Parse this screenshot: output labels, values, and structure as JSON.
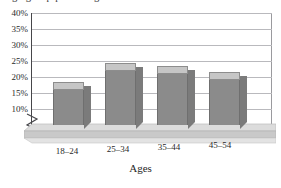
{
  "chart_data": {
    "type": "bar",
    "title": "Age group percentages",
    "title_clipped": true,
    "subtitle": "",
    "xlabel": "Ages",
    "ylabel": "",
    "categories": [
      "18–24",
      "25–34",
      "35–44",
      "45–54"
    ],
    "values": [
      16,
      22,
      21,
      19
    ],
    "value_labels": [
      "16%",
      "22%",
      "21%",
      "19%"
    ],
    "ylim": [
      10,
      40
    ],
    "ytick_values": [
      40,
      35,
      30,
      25,
      20,
      15,
      10
    ],
    "ytick_labels": [
      "40%",
      "35%",
      "30%",
      "25%",
      "20%",
      "15%",
      "10%"
    ],
    "grid": true,
    "grid_axis": "y",
    "legend": false,
    "legend_position": "none",
    "axis_break": true,
    "axis_break_note": "y-axis broken below 10%",
    "three_d": true,
    "series": [
      {
        "name": "Percent",
        "values": [
          16,
          22,
          21,
          19
        ]
      }
    ],
    "colors": {
      "bar_front": "#8b8b8b",
      "bar_top": "#c6c6c6",
      "bar_side": "#7b7b7b",
      "gridline": "#b9b9bd",
      "frame": "#46464a",
      "floor_top": "#d8d8d8",
      "floor_front": "#c0c0c0",
      "text": "#1f1f1f",
      "background": "#ffffff"
    }
  },
  "yticks": {
    "t0": "40%",
    "t1": "35%",
    "t2": "30%",
    "t3": "25%",
    "t4": "20%",
    "t5": "15%",
    "t6": "10%"
  },
  "xticks": {
    "c0": "18–24",
    "c1": "25–34",
    "c2": "35–44",
    "c3": "45–54"
  },
  "axis": {
    "x_title": "Ages"
  },
  "title": {
    "text": "Age group percentages"
  },
  "icons": {
    "axis_break": "axis-break-zigzag-icon"
  }
}
